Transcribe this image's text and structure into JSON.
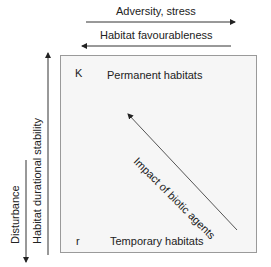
{
  "diagram": {
    "top_arrows": [
      {
        "label": "Adversity, stress",
        "direction": "right"
      },
      {
        "label": "Habitat favourableness",
        "direction": "left"
      }
    ],
    "left_arrows": [
      {
        "label": "Habitat durational stability",
        "direction": "up"
      },
      {
        "label": "Disturbance",
        "direction": "down"
      }
    ],
    "box": {
      "corner_top": "K",
      "corner_bottom": "r",
      "top_label": "Permanent habitats",
      "bottom_label": "Temporary habitats",
      "diagonal_label": "Impact of biotic agents",
      "diagonal_direction": "up-left"
    },
    "colors": {
      "line": "#333333",
      "box_fill": "#f6f6f6",
      "box_border": "#9a9a9a",
      "text": "#222222"
    }
  }
}
